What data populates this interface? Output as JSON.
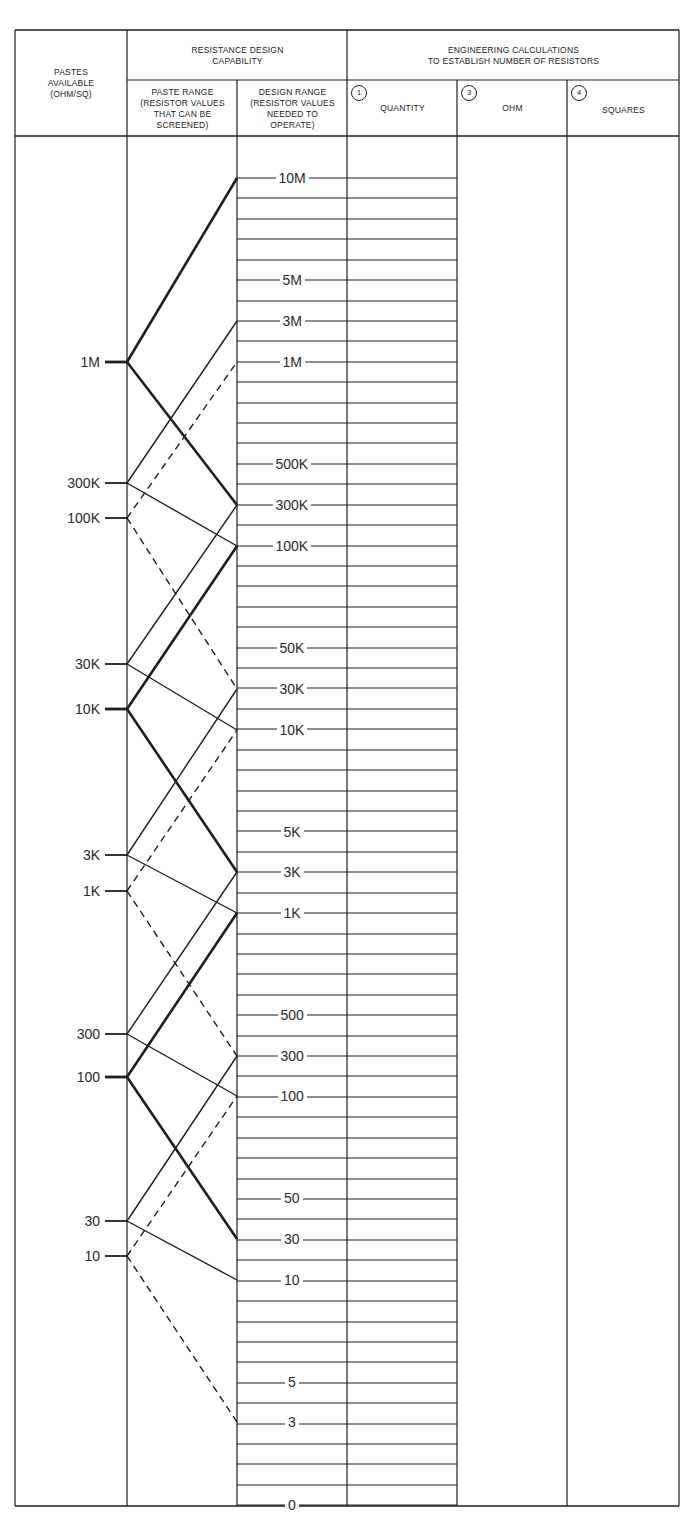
{
  "header": {
    "pastes_available": "PASTES\nAVAILABLE\n(OHM/SQ)",
    "resistance_design_capability": "RESISTANCE DESIGN\nCAPABILITY",
    "paste_range": "PASTE RANGE\n(RESISTOR VALUES\nTHAT CAN BE\nSCREENED)",
    "design_range": "DESIGN RANGE\n(RESISTOR VALUES\nNEEDED TO\nOPERATE)",
    "engineering_calculations": "ENGINEERING CALCULATIONS\nTO ESTABLISH NUMBER OF RESISTORS",
    "columns": [
      {
        "number": "1",
        "label": "QUANTITY"
      },
      {
        "number": "3",
        "label": "OHM"
      },
      {
        "number": "4",
        "label": "SQUARES"
      }
    ]
  },
  "pastes": [
    {
      "label": "1M",
      "y": 362,
      "style": "bold"
    },
    {
      "label": "300K",
      "y": 483,
      "style": "thin"
    },
    {
      "label": "100K",
      "y": 518,
      "style": "dashed"
    },
    {
      "label": "30K",
      "y": 664,
      "style": "thin"
    },
    {
      "label": "10K",
      "y": 709,
      "style": "bold"
    },
    {
      "label": "3K",
      "y": 855,
      "style": "thin"
    },
    {
      "label": "1K",
      "y": 891,
      "style": "dashed"
    },
    {
      "label": "300",
      "y": 1034,
      "style": "thin"
    },
    {
      "label": "100",
      "y": 1077,
      "style": "bold"
    },
    {
      "label": "30",
      "y": 1221,
      "style": "thin"
    },
    {
      "label": "10",
      "y": 1256,
      "style": "dashed"
    }
  ],
  "design_scale": [
    {
      "label": "10M",
      "y": 178
    },
    {
      "label": "5M",
      "y": 280
    },
    {
      "label": "3M",
      "y": 321
    },
    {
      "label": "1M",
      "y": 362
    },
    {
      "label": "500K",
      "y": 464
    },
    {
      "label": "300K",
      "y": 505
    },
    {
      "label": "100K",
      "y": 546
    },
    {
      "label": "50K",
      "y": 648
    },
    {
      "label": "30K",
      "y": 689
    },
    {
      "label": "10K",
      "y": 730
    },
    {
      "label": "5K",
      "y": 832
    },
    {
      "label": "3K",
      "y": 872
    },
    {
      "label": "1K",
      "y": 913
    },
    {
      "label": "500",
      "y": 1015
    },
    {
      "label": "300",
      "y": 1056
    },
    {
      "label": "100",
      "y": 1096
    },
    {
      "label": "50",
      "y": 1198
    },
    {
      "label": "30",
      "y": 1239
    },
    {
      "label": "10",
      "y": 1280
    },
    {
      "label": "5",
      "y": 1382
    },
    {
      "label": "3",
      "y": 1422
    },
    {
      "label": "0",
      "y": 1505
    }
  ],
  "range_lines": [
    {
      "from": "1M",
      "to_y": 178,
      "style": "bold"
    },
    {
      "from": "1M",
      "to_y": 505,
      "style": "bold"
    },
    {
      "from": "300K",
      "to_y": 321,
      "style": "thin"
    },
    {
      "from": "300K",
      "to_y": 546,
      "style": "thin"
    },
    {
      "from": "100K",
      "to_y": 362,
      "style": "dashed"
    },
    {
      "from": "100K",
      "to_y": 689,
      "style": "dashed"
    },
    {
      "from": "30K",
      "to_y": 505,
      "style": "thin"
    },
    {
      "from": "30K",
      "to_y": 730,
      "style": "thin"
    },
    {
      "from": "10K",
      "to_y": 546,
      "style": "bold"
    },
    {
      "from": "10K",
      "to_y": 872,
      "style": "bold"
    },
    {
      "from": "3K",
      "to_y": 689,
      "style": "thin"
    },
    {
      "from": "3K",
      "to_y": 913,
      "style": "thin"
    },
    {
      "from": "1K",
      "to_y": 730,
      "style": "dashed"
    },
    {
      "from": "1K",
      "to_y": 1056,
      "style": "dashed"
    },
    {
      "from": "300",
      "to_y": 872,
      "style": "thin"
    },
    {
      "from": "300",
      "to_y": 1096,
      "style": "thin"
    },
    {
      "from": "100",
      "to_y": 913,
      "style": "bold"
    },
    {
      "from": "100",
      "to_y": 1239,
      "style": "bold"
    },
    {
      "from": "30",
      "to_y": 1056,
      "style": "thin"
    },
    {
      "from": "30",
      "to_y": 1280,
      "style": "thin"
    },
    {
      "from": "10",
      "to_y": 1096,
      "style": "dashed"
    },
    {
      "from": "10",
      "to_y": 1422,
      "style": "dashed"
    }
  ],
  "grid": {
    "first_row_y": 178,
    "row_step": 20.42,
    "last_row_y": 1505
  }
}
